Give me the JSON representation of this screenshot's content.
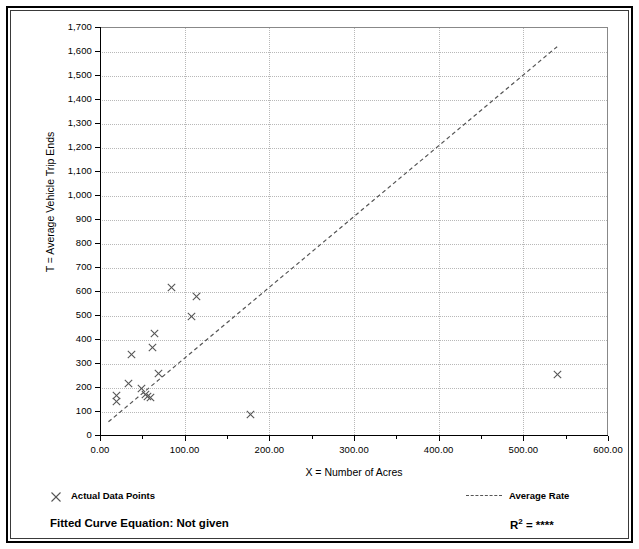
{
  "chart_data": {
    "type": "scatter",
    "title": "",
    "xlabel": "X = Number of Acres",
    "ylabel": "T = Average Vehicle Trip Ends",
    "xlim": [
      0,
      600
    ],
    "ylim": [
      0,
      1700
    ],
    "x_tick_labels": [
      "0.00",
      "100.00",
      "200.00",
      "300.00",
      "400.00",
      "500.00",
      "600.00"
    ],
    "x_tick_values": [
      0,
      100,
      200,
      300,
      400,
      500,
      600
    ],
    "x_minor_step": 50,
    "y_tick_labels": [
      "0",
      "100",
      "200",
      "300",
      "400",
      "500",
      "600",
      "700",
      "800",
      "900",
      "1,000",
      "1,100",
      "1,200",
      "1,300",
      "1,400",
      "1,500",
      "1,600",
      "1,700"
    ],
    "y_tick_values": [
      0,
      100,
      200,
      300,
      400,
      500,
      600,
      700,
      800,
      900,
      1000,
      1100,
      1200,
      1300,
      1400,
      1500,
      1600,
      1700
    ],
    "grid": true,
    "grid_color": "#b8b8b8",
    "marker": "x",
    "marker_color": "#555555",
    "series": [
      {
        "name": "Actual Data Points",
        "points": [
          [
            19,
            170
          ],
          [
            20,
            142
          ],
          [
            34,
            218
          ],
          [
            37,
            340
          ],
          [
            49,
            200
          ],
          [
            54,
            172
          ],
          [
            56,
            165
          ],
          [
            60,
            162
          ],
          [
            62,
            370
          ],
          [
            64,
            428
          ],
          [
            69,
            260
          ],
          [
            85,
            618
          ],
          [
            108,
            500
          ],
          [
            114,
            580
          ],
          [
            178,
            90
          ],
          [
            540,
            255
          ]
        ]
      }
    ],
    "trendline": {
      "name": "Average Rate",
      "style": "dashed",
      "color": "#555555",
      "x_start": 10,
      "y_start": 55,
      "x_end": 541,
      "y_end": 1622
    }
  },
  "legend": {
    "data_points_marker": "x-marker-icon",
    "data_points_label": "Actual Data Points",
    "average_rate_marker": "dashed-line-icon",
    "average_rate_label": "Average Rate"
  },
  "footer": {
    "fitted_curve_label": "Fitted Curve Equation:  Not given",
    "r_squared_prefix": "R",
    "r_squared_exponent": "2",
    "r_squared_value": " = ****"
  }
}
